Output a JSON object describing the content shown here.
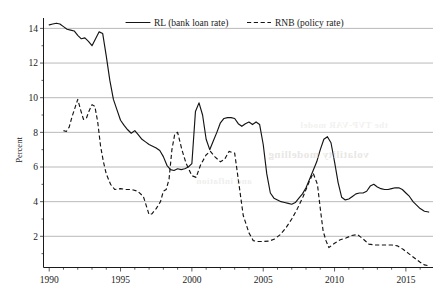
{
  "chart_data": {
    "type": "line",
    "title": "",
    "xlabel": "",
    "ylabel": "Percent",
    "xlim": [
      1989.6,
      2016.9
    ],
    "ylim": [
      0.2,
      14.6
    ],
    "grid": true,
    "legend_position": "top-center",
    "y_ticks": [
      2,
      4,
      6,
      8,
      10,
      12,
      14
    ],
    "y_tick_labels": [
      "2",
      "4",
      "6",
      "8",
      "10",
      "12",
      "14"
    ],
    "x_ticks": [
      1990,
      1995,
      2000,
      2005,
      2010,
      2015
    ],
    "x_tick_labels": [
      "1990",
      "1995",
      "2000",
      "2005",
      "2010",
      "2015"
    ],
    "x_minor_tick_step": 1,
    "series": [
      {
        "name": "RL (bank loan rate)",
        "style": "solid",
        "color": "#141414",
        "x": [
          1990.0,
          1990.25,
          1990.5,
          1990.75,
          1991.0,
          1991.25,
          1991.5,
          1991.75,
          1992.0,
          1992.25,
          1992.5,
          1992.75,
          1993.0,
          1993.25,
          1993.5,
          1993.75,
          1994.0,
          1994.25,
          1994.5,
          1994.75,
          1995.0,
          1995.25,
          1995.5,
          1995.75,
          1996.0,
          1996.25,
          1996.5,
          1996.75,
          1997.0,
          1997.25,
          1997.5,
          1997.75,
          1998.0,
          1998.25,
          1998.5,
          1998.75,
          1999.0,
          1999.25,
          1999.5,
          1999.75,
          2000.0,
          2000.25,
          2000.5,
          2000.75,
          2001.0,
          2001.25,
          2001.5,
          2001.75,
          2002.0,
          2002.25,
          2002.5,
          2002.75,
          2003.0,
          2003.25,
          2003.5,
          2003.75,
          2004.0,
          2004.25,
          2004.5,
          2004.75,
          2005.0,
          2005.25,
          2005.5,
          2005.75,
          2006.0,
          2006.25,
          2006.5,
          2006.75,
          2007.0,
          2007.25,
          2007.5,
          2007.75,
          2008.0,
          2008.25,
          2008.5,
          2008.75,
          2009.0,
          2009.25,
          2009.5,
          2009.75,
          2010.0,
          2010.25,
          2010.5,
          2010.75,
          2011.0,
          2011.25,
          2011.5,
          2011.75,
          2012.0,
          2012.25,
          2012.5,
          2012.75,
          2013.0,
          2013.25,
          2013.5,
          2013.75,
          2014.0,
          2014.25,
          2014.5,
          2014.75,
          2015.0,
          2015.25,
          2015.5,
          2015.75,
          2016.0,
          2016.3,
          2016.6
        ],
        "y": [
          14.2,
          14.25,
          14.3,
          14.25,
          14.1,
          13.95,
          13.9,
          13.85,
          13.6,
          13.4,
          13.45,
          13.25,
          13.0,
          13.4,
          13.8,
          13.7,
          12.4,
          11.0,
          9.9,
          9.3,
          8.7,
          8.4,
          8.15,
          7.95,
          8.1,
          7.85,
          7.6,
          7.45,
          7.3,
          7.2,
          7.1,
          6.95,
          6.6,
          6.1,
          5.85,
          5.8,
          5.9,
          5.85,
          5.9,
          6.0,
          6.2,
          9.2,
          9.7,
          9.0,
          7.6,
          7.0,
          7.5,
          8.0,
          8.55,
          8.8,
          8.85,
          8.85,
          8.8,
          8.5,
          8.35,
          8.5,
          8.6,
          8.45,
          8.6,
          8.45,
          7.3,
          5.6,
          4.5,
          4.2,
          4.1,
          4.0,
          3.95,
          3.9,
          3.85,
          3.95,
          4.2,
          4.45,
          4.8,
          5.3,
          5.8,
          6.3,
          7.0,
          7.6,
          7.75,
          7.4,
          6.3,
          5.1,
          4.25,
          4.1,
          4.15,
          4.3,
          4.45,
          4.5,
          4.5,
          4.6,
          4.9,
          5.0,
          4.85,
          4.75,
          4.7,
          4.7,
          4.75,
          4.8,
          4.8,
          4.7,
          4.5,
          4.3,
          4.0,
          3.8,
          3.6,
          3.45,
          3.4
        ]
      },
      {
        "name": "RNB (policy rate)",
        "style": "dashed",
        "color": "#141414",
        "x": [
          1991.0,
          1991.2,
          1991.4,
          1991.6,
          1991.8,
          1992.0,
          1992.2,
          1992.4,
          1992.6,
          1992.8,
          1993.0,
          1993.2,
          1993.4,
          1993.6,
          1993.8,
          1994.0,
          1994.3,
          1994.6,
          1995.0,
          1995.4,
          1995.8,
          1996.2,
          1996.6,
          1997.0,
          1997.2,
          1997.5,
          1997.8,
          1998.0,
          1998.2,
          1998.4,
          1998.6,
          1998.8,
          1999.0,
          1999.3,
          1999.6,
          2000.0,
          2000.3,
          2000.6,
          2001.0,
          2001.3,
          2001.6,
          2002.0,
          2002.3,
          2002.6,
          2003.0,
          2003.3,
          2003.6,
          2004.0,
          2004.3,
          2004.6,
          2005.0,
          2005.4,
          2005.8,
          2006.2,
          2006.6,
          2007.0,
          2007.4,
          2007.8,
          2008.2,
          2008.5,
          2008.8,
          2009.0,
          2009.2,
          2009.4,
          2009.6,
          2010.0,
          2010.4,
          2010.8,
          2011.2,
          2011.6,
          2012.0,
          2012.4,
          2012.8,
          2013.2,
          2013.6,
          2014.0,
          2014.4,
          2014.8,
          2015.2,
          2015.6,
          2016.0,
          2016.3,
          2016.6
        ],
        "y": [
          8.1,
          8.05,
          8.3,
          8.9,
          9.4,
          9.9,
          9.3,
          8.75,
          8.8,
          9.25,
          9.6,
          9.5,
          8.6,
          7.2,
          6.3,
          5.6,
          5.0,
          4.7,
          4.75,
          4.7,
          4.7,
          4.6,
          4.3,
          3.25,
          3.3,
          3.6,
          4.0,
          4.6,
          4.7,
          5.3,
          7.0,
          7.9,
          8.0,
          7.0,
          6.2,
          5.5,
          5.4,
          6.1,
          6.7,
          6.9,
          6.6,
          6.3,
          6.45,
          6.9,
          6.8,
          5.0,
          3.2,
          2.2,
          1.75,
          1.7,
          1.7,
          1.72,
          1.85,
          2.1,
          2.5,
          3.0,
          3.6,
          4.3,
          5.1,
          5.65,
          5.0,
          3.6,
          2.3,
          1.75,
          1.35,
          1.6,
          1.8,
          1.9,
          2.05,
          2.1,
          1.85,
          1.55,
          1.5,
          1.5,
          1.5,
          1.5,
          1.45,
          1.25,
          1.0,
          0.75,
          0.5,
          0.35,
          0.3
        ]
      }
    ]
  },
  "legend": {
    "items": [
      {
        "label": "RL (bank loan rate)",
        "style": "solid"
      },
      {
        "label": "RNB (policy rate)",
        "style": "dashed"
      }
    ]
  },
  "scan_artifacts": {
    "note": "faint mirrored show-through text from reverse page",
    "lines": [
      "volatility modelling",
      "the TVP-VAR model",
      "and inflation"
    ]
  }
}
